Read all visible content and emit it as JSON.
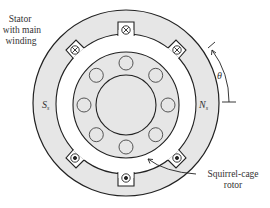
{
  "diagram": {
    "type": "single-phase induction motor cross-section",
    "labels": {
      "stator_line1": "Stator",
      "stator_line2": "with main",
      "stator_line3": "winding",
      "south_pole": "S",
      "south_sub": "s",
      "north_pole": "N",
      "north_sub": "s",
      "angle": "θ",
      "rotor_line1": "Squirrel-cage",
      "rotor_line2": "rotor"
    },
    "winding_symbols": {
      "into_page": "⊗",
      "out_of_page": "⊙"
    },
    "colors": {
      "fill": "#e6e6e6",
      "stroke": "#222222",
      "background": "#ffffff"
    }
  }
}
